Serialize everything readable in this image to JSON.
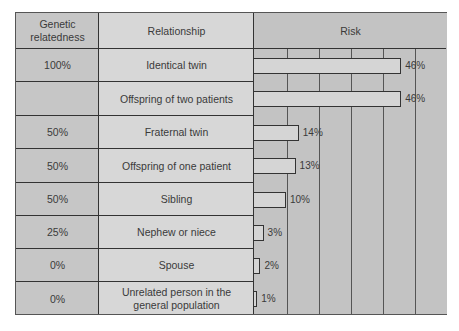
{
  "headers": {
    "genetic_relatedness": "Genetic relatedness",
    "relationship": "Relationship",
    "risk": "Risk"
  },
  "rows": [
    {
      "relatedness": "100%",
      "relationship": "Identical twin",
      "risk": 46,
      "risk_label": "46%"
    },
    {
      "relatedness": "",
      "relationship": "Offspring of two patients",
      "risk": 46,
      "risk_label": "46%"
    },
    {
      "relatedness": "50%",
      "relationship": "Fraternal twin",
      "risk": 14,
      "risk_label": "14%"
    },
    {
      "relatedness": "50%",
      "relationship": "Offspring of one patient",
      "risk": 13,
      "risk_label": "13%"
    },
    {
      "relatedness": "50%",
      "relationship": "Sibling",
      "risk": 10,
      "risk_label": "10%"
    },
    {
      "relatedness": "25%",
      "relationship": "Nephew or niece",
      "risk": 3,
      "risk_label": "3%"
    },
    {
      "relatedness": "0%",
      "relationship": "Spouse",
      "risk": 2,
      "risk_label": "2%"
    },
    {
      "relatedness": "0%",
      "relationship": "Unrelated person in the general population",
      "risk": 1,
      "risk_label": "1%"
    }
  ],
  "chart_data": {
    "type": "bar",
    "orientation": "horizontal",
    "title": "",
    "xlabel": "Risk",
    "ylabel": "Relationship",
    "categories": [
      "Identical twin",
      "Offspring of two patients",
      "Fraternal twin",
      "Offspring of one patient",
      "Sibling",
      "Nephew or niece",
      "Spouse",
      "Unrelated person in the general population"
    ],
    "genetic_relatedness": [
      "100%",
      "",
      "50%",
      "50%",
      "50%",
      "25%",
      "0%",
      "0%"
    ],
    "values": [
      46,
      46,
      14,
      13,
      10,
      3,
      2,
      1
    ],
    "data_labels": [
      "46%",
      "46%",
      "14%",
      "13%",
      "10%",
      "3%",
      "2%",
      "1%"
    ],
    "xlim": [
      0,
      55
    ],
    "grid": true,
    "grid_interval": 10,
    "legend": "none"
  }
}
